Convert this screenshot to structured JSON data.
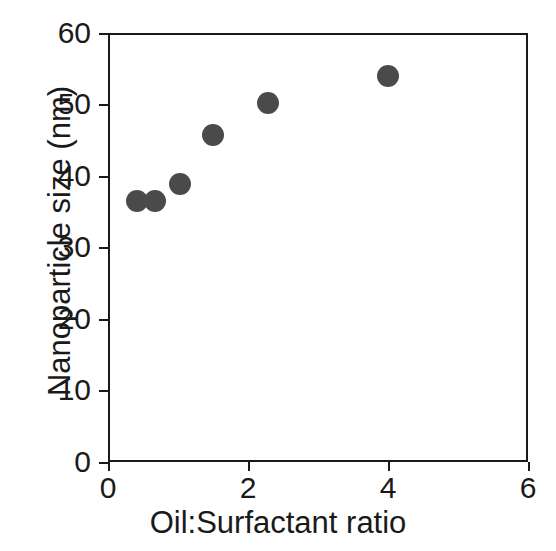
{
  "chart_data": {
    "type": "scatter",
    "title": "",
    "xlabel": "Oil:Surfactant ratio",
    "ylabel": "Nanoparticle size (nm)",
    "xlim": [
      0,
      6
    ],
    "ylim": [
      0,
      60
    ],
    "xticks": [
      "0",
      "2",
      "4",
      "6"
    ],
    "yticks": [
      "0",
      "10",
      "20",
      "30",
      "40",
      "50",
      "60"
    ],
    "xtick_values": [
      0,
      2,
      4,
      6
    ],
    "ytick_values": [
      0,
      10,
      20,
      30,
      40,
      50,
      60
    ],
    "grid": false,
    "legend": null,
    "marker": {
      "shape": "circle",
      "color": "#4a4a4a",
      "size_px": 22
    },
    "x": [
      0.41,
      0.67,
      1.03,
      1.5,
      2.29,
      4.0
    ],
    "y": [
      36.5,
      36.5,
      38.9,
      45.7,
      50.2,
      54.0
    ],
    "points": [
      {
        "x": 0.41,
        "y": 36.5
      },
      {
        "x": 0.67,
        "y": 36.5
      },
      {
        "x": 1.03,
        "y": 38.9
      },
      {
        "x": 1.5,
        "y": 45.7
      },
      {
        "x": 2.29,
        "y": 50.2
      },
      {
        "x": 4.0,
        "y": 54.0
      }
    ]
  },
  "figure": {
    "background_color": "#ffffff",
    "axis_color": "#1a1a1a"
  }
}
